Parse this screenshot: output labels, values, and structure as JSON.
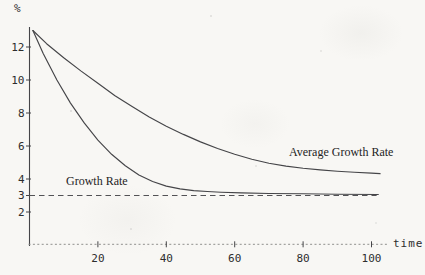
{
  "figure": {
    "background": "#f8f7f4",
    "ink_color": "#454548",
    "text_color": "#2d2d2d"
  },
  "labels": {
    "y_axis_unit": "%",
    "x_axis_unit": "time",
    "growth_rate_annotation": "Growth Rate",
    "average_growth_rate_annotation": "Average Growth Rate"
  },
  "chart_data": {
    "type": "line",
    "title": "",
    "xlabel": "time",
    "ylabel": "%",
    "xlim": [
      0,
      105
    ],
    "ylim": [
      0,
      13.2
    ],
    "x_ticks": [
      20,
      40,
      60,
      80,
      100
    ],
    "y_ticks": [
      2,
      3,
      4,
      6,
      8,
      10,
      12
    ],
    "grid": false,
    "legend_position": "inline-annotations",
    "dashed_reference_line": {
      "y": 3,
      "style": "dashed",
      "x_start": 0,
      "x_end": 101.5
    },
    "series": [
      {
        "name": "Growth Rate",
        "style": "solid",
        "x": [
          1,
          4,
          8,
          12,
          16,
          20,
          24,
          28,
          32,
          36,
          40,
          44,
          48,
          52,
          56,
          62,
          70,
          80,
          90,
          102
        ],
        "y": [
          13.0,
          11.6,
          10.0,
          8.6,
          7.4,
          6.35,
          5.5,
          4.8,
          4.25,
          3.85,
          3.57,
          3.4,
          3.3,
          3.24,
          3.2,
          3.16,
          3.12,
          3.1,
          3.08,
          3.06
        ]
      },
      {
        "name": "Average Growth Rate",
        "style": "solid",
        "x": [
          1,
          5,
          10,
          15,
          20,
          25,
          30,
          35,
          40,
          45,
          50,
          55,
          60,
          65,
          70,
          75,
          80,
          85,
          90,
          95,
          100,
          102.5
        ],
        "y": [
          13.0,
          12.2,
          11.35,
          10.55,
          9.8,
          9.05,
          8.4,
          7.75,
          7.2,
          6.7,
          6.25,
          5.85,
          5.5,
          5.2,
          4.95,
          4.78,
          4.65,
          4.55,
          4.47,
          4.41,
          4.36,
          4.33
        ]
      }
    ]
  }
}
